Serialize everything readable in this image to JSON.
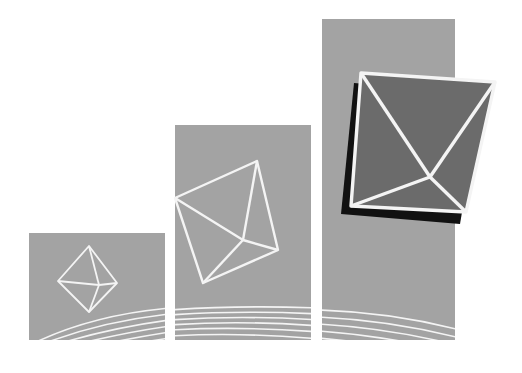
{
  "illustration": {
    "description": "Three ascending grey panels with white wireframe polyhedra and curved baseline stripes",
    "colors": {
      "background": "#ffffff",
      "panel": "#a3a3a3",
      "shape_fill_dark": "#6b6b6b",
      "shadow": "#111111",
      "line": "#f4f4f4"
    },
    "panels": [
      {
        "name": "small",
        "x": 29,
        "y": 233,
        "w": 136,
        "h": 107
      },
      {
        "name": "medium",
        "x": 175,
        "y": 125,
        "w": 136,
        "h": 215
      },
      {
        "name": "large",
        "x": 322,
        "y": 19,
        "w": 133,
        "h": 321
      }
    ],
    "shapes": [
      {
        "name": "octahedron-small",
        "points": {
          "top": [
            89,
            246
          ],
          "left": [
            58,
            281
          ],
          "right": [
            117,
            283
          ],
          "bottom": [
            89,
            312
          ],
          "center": [
            99,
            285
          ]
        }
      },
      {
        "name": "octahedron-medium",
        "points": {
          "top": [
            257,
            161
          ],
          "left": [
            175,
            198
          ],
          "bottom": [
            203,
            283
          ],
          "right": [
            278,
            250
          ],
          "center": [
            243,
            240
          ]
        }
      },
      {
        "name": "octahedron-large",
        "points": {
          "tl": [
            361,
            73
          ],
          "tr": [
            495,
            82
          ],
          "br": [
            466,
            212
          ],
          "bl": [
            351,
            206
          ],
          "center": [
            430,
            177
          ]
        }
      }
    ]
  }
}
